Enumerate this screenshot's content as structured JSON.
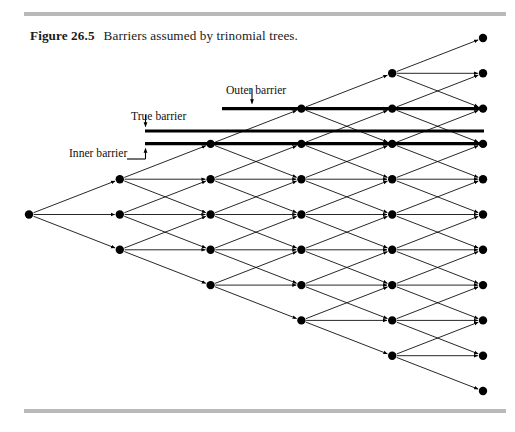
{
  "figure": {
    "number": "Figure 26.5",
    "caption": "Barriers assumed by trinomial trees."
  },
  "labels": {
    "outer": "Outer barrier",
    "true": "True barrier",
    "inner": "Inner barrier"
  },
  "colors": {
    "ink": "#000000",
    "rule": "#b9b9b9",
    "background": "#ffffff"
  },
  "chart_data": {
    "type": "diagram",
    "title": "Barriers assumed by trinomial trees",
    "geometry": {
      "root_x": 29,
      "root_y": 214.5,
      "col_step_x": 90.8,
      "row_step_y": 35.3,
      "node_radius": 4.2,
      "columns": 6,
      "nodes_per_column": [
        1,
        3,
        5,
        7,
        9,
        11
      ]
    },
    "node_columns_x": [
      29,
      119.8,
      210.6,
      301.4,
      392.2,
      483
    ],
    "node_rows_y": [
      [
        214.5
      ],
      [
        179.2,
        214.5,
        249.8
      ],
      [
        143.9,
        179.2,
        214.5,
        249.8,
        285.1
      ],
      [
        108.6,
        143.9,
        179.2,
        214.5,
        249.8,
        285.1,
        320.4
      ],
      [
        73.3,
        108.6,
        143.9,
        179.2,
        214.5,
        249.8,
        285.1,
        320.4,
        355.7
      ],
      [
        38.0,
        73.3,
        108.6,
        143.9,
        179.2,
        214.5,
        249.8,
        285.1,
        320.4,
        355.7,
        391.0
      ]
    ],
    "barriers": [
      {
        "name": "Outer barrier",
        "y": 108.6,
        "x_start": 222,
        "x_end": 484,
        "thickness": 3.4,
        "label_pointer": "down-arrow"
      },
      {
        "name": "True barrier",
        "y": 131.0,
        "x_start": 145,
        "x_end": 484,
        "thickness": 3.2,
        "label_pointer": "down-arrow"
      },
      {
        "name": "Inner barrier",
        "y": 143.6,
        "x_start": 145,
        "x_end": 484,
        "thickness": 3.4,
        "label_pointer": "up-arrow"
      }
    ],
    "edge_style": {
      "branches_per_node": 3,
      "directions": [
        "up",
        "flat",
        "down"
      ],
      "arrowheads": true,
      "stroke_width": 0.85
    }
  }
}
